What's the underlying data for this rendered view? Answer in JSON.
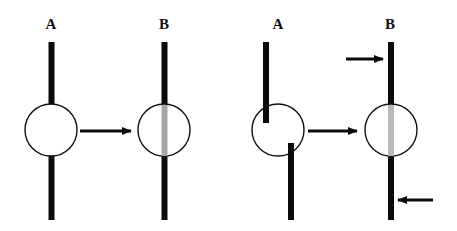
{
  "panels": [
    {
      "name": "left",
      "labels": {
        "a": "A",
        "b": "B"
      }
    },
    {
      "name": "right",
      "labels": {
        "a": "A",
        "b": "B"
      }
    }
  ],
  "colors": {
    "bar": "#0a0a0a",
    "circle_stroke": "#111111",
    "fill_gray": "#b4b4b4",
    "background": "#ffffff"
  }
}
